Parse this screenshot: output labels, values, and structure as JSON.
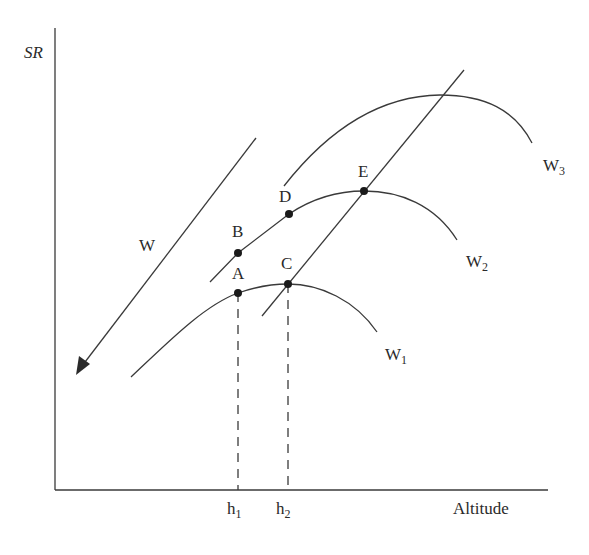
{
  "diagram": {
    "axes": {
      "y_label": "SR",
      "x_label": "Altitude",
      "x_ticks": [
        {
          "base": "h",
          "sub": "1"
        },
        {
          "base": "h",
          "sub": "2"
        }
      ]
    },
    "arrow_label": "W",
    "curves": [
      {
        "base": "W",
        "sub": "1"
      },
      {
        "base": "W",
        "sub": "2"
      },
      {
        "base": "W",
        "sub": "3"
      }
    ],
    "points": [
      "A",
      "B",
      "C",
      "D",
      "E"
    ],
    "colors": {
      "line": "#3a3a3a",
      "text": "#2a2a2a",
      "background": "#ffffff"
    }
  }
}
